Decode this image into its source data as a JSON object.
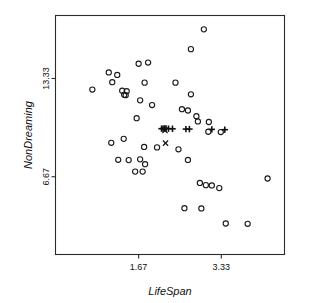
{
  "chart_data": {
    "type": "scatter",
    "title": "",
    "xlabel": "LifeSpan",
    "ylabel": "NonDreaming",
    "xticks": [
      1.67,
      3.33
    ],
    "xtick_labels": [
      "1.67",
      "3.33"
    ],
    "yticks": [
      6.67,
      13.33
    ],
    "ytick_labels": [
      "6.67",
      "13.33"
    ],
    "xlim": [
      0.0,
      4.6
    ],
    "ylim": [
      1.4,
      17.6
    ],
    "grid": false,
    "legend": null,
    "series": [
      {
        "name": "observed",
        "marker": "circle",
        "points": [
          [
            2.98,
            16.66
          ],
          [
            2.72,
            15.32
          ],
          [
            1.86,
            14.41
          ],
          [
            1.67,
            14.33
          ],
          [
            1.07,
            13.74
          ],
          [
            1.24,
            13.57
          ],
          [
            1.14,
            13.08
          ],
          [
            1.79,
            13.05
          ],
          [
            2.41,
            13.05
          ],
          [
            0.74,
            12.58
          ],
          [
            1.34,
            12.5
          ],
          [
            1.43,
            12.47
          ],
          [
            1.38,
            12.22
          ],
          [
            1.41,
            12.2
          ],
          [
            2.72,
            12.26
          ],
          [
            1.7,
            11.85
          ],
          [
            1.94,
            11.53
          ],
          [
            2.54,
            11.25
          ],
          [
            2.66,
            11.16
          ],
          [
            1.63,
            10.64
          ],
          [
            2.83,
            10.77
          ],
          [
            2.86,
            10.42
          ],
          [
            3.08,
            10.38
          ],
          [
            3.07,
            9.72
          ],
          [
            3.32,
            9.7
          ],
          [
            1.12,
            8.97
          ],
          [
            1.37,
            9.24
          ],
          [
            1.78,
            8.69
          ],
          [
            2.04,
            8.66
          ],
          [
            2.47,
            8.53
          ],
          [
            1.26,
            7.82
          ],
          [
            1.47,
            7.8
          ],
          [
            1.7,
            7.85
          ],
          [
            1.8,
            7.52
          ],
          [
            1.6,
            7.02
          ],
          [
            1.75,
            7.02
          ],
          [
            2.66,
            7.81
          ],
          [
            4.26,
            6.55
          ],
          [
            2.9,
            6.25
          ],
          [
            3.02,
            6.1
          ],
          [
            3.14,
            6.08
          ],
          [
            3.29,
            5.9
          ],
          [
            2.59,
            4.54
          ],
          [
            2.93,
            4.52
          ],
          [
            3.42,
            3.5
          ],
          [
            3.86,
            3.48
          ]
        ]
      },
      {
        "name": "fitted",
        "marker": "plus",
        "points": [
          [
            2.13,
            9.93
          ],
          [
            2.16,
            9.93
          ],
          [
            2.19,
            9.95
          ],
          [
            2.22,
            9.94
          ],
          [
            2.27,
            9.93
          ],
          [
            2.35,
            9.92
          ],
          [
            2.62,
            9.9
          ],
          [
            2.69,
            9.9
          ],
          [
            3.14,
            9.88
          ],
          [
            3.4,
            9.86
          ]
        ]
      },
      {
        "name": "outlier",
        "marker": "cross",
        "points": [
          [
            2.2,
            9.8
          ],
          [
            2.21,
            8.95
          ]
        ]
      }
    ]
  },
  "style": {
    "axis_color": "#2b2b2b",
    "marker_color": "#1a1a1a",
    "background": "#ffffff"
  }
}
